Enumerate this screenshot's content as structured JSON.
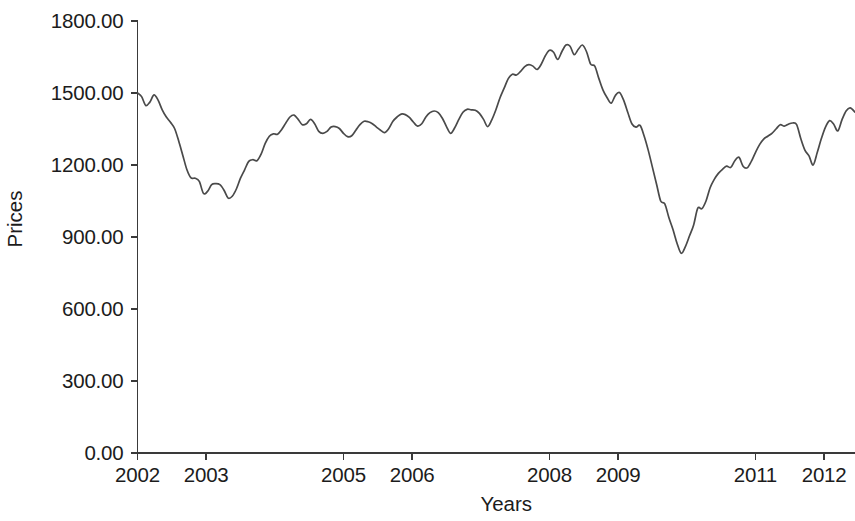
{
  "chart_data": {
    "type": "line",
    "title": "",
    "xlabel": "Years",
    "ylabel": "Prices",
    "grid": false,
    "legend": false,
    "legend_position": "none",
    "line_color": "#4a4a4a",
    "axis_color": "#3a3a3a",
    "background_color": "#ffffff",
    "xlim": [
      2002.0,
      2012.45
    ],
    "ylim": [
      0.0,
      1800.0
    ],
    "y_ticks": [
      0,
      300,
      600,
      900,
      1200,
      1500,
      1800
    ],
    "y_tick_labels": [
      "0.00",
      "300.00",
      "600.00",
      "900.00",
      "1200.00",
      "1500.00",
      "1800.00"
    ],
    "x_ticks": [
      2002,
      2003,
      2005,
      2006,
      2008,
      2009,
      2011,
      2012
    ],
    "x_tick_labels": [
      "2002",
      "2003",
      "2005",
      "2006",
      "2008",
      "2009",
      "2011",
      "2012"
    ],
    "series": [
      {
        "name": "Prices",
        "x": [
          2002.0,
          2002.06,
          2002.12,
          2002.18,
          2002.24,
          2002.3,
          2002.36,
          2002.42,
          2002.48,
          2002.54,
          2002.6,
          2002.66,
          2002.72,
          2002.78,
          2002.84,
          2002.9,
          2002.96,
          2003.02,
          2003.08,
          2003.14,
          2003.2,
          2003.26,
          2003.32,
          2003.38,
          2003.44,
          2003.5,
          2003.56,
          2003.62,
          2003.68,
          2003.74,
          2003.8,
          2003.86,
          2003.92,
          2003.98,
          2004.04,
          2004.1,
          2004.16,
          2004.22,
          2004.28,
          2004.34,
          2004.4,
          2004.46,
          2004.52,
          2004.58,
          2004.64,
          2004.7,
          2004.76,
          2004.82,
          2004.88,
          2004.94,
          2005.0,
          2005.06,
          2005.12,
          2005.18,
          2005.24,
          2005.3,
          2005.36,
          2005.42,
          2005.48,
          2005.54,
          2005.6,
          2005.66,
          2005.72,
          2005.78,
          2005.84,
          2005.9,
          2005.96,
          2006.02,
          2006.08,
          2006.14,
          2006.2,
          2006.26,
          2006.32,
          2006.38,
          2006.44,
          2006.5,
          2006.56,
          2006.62,
          2006.68,
          2006.74,
          2006.8,
          2006.86,
          2006.92,
          2006.98,
          2007.04,
          2007.1,
          2007.16,
          2007.22,
          2007.28,
          2007.34,
          2007.4,
          2007.46,
          2007.52,
          2007.58,
          2007.64,
          2007.7,
          2007.76,
          2007.82,
          2007.88,
          2007.94,
          2008.0,
          2008.06,
          2008.12,
          2008.18,
          2008.24,
          2008.3,
          2008.36,
          2008.42,
          2008.48,
          2008.54,
          2008.6,
          2008.66,
          2008.72,
          2008.78,
          2008.84,
          2008.9,
          2008.96,
          2009.02,
          2009.08,
          2009.14,
          2009.2,
          2009.26,
          2009.32,
          2009.38,
          2009.44,
          2009.5,
          2009.56,
          2009.62,
          2009.68,
          2009.74,
          2009.8,
          2009.86,
          2009.92,
          2009.98,
          2010.04,
          2010.1,
          2010.16,
          2010.22,
          2010.28,
          2010.34,
          2010.4,
          2010.46,
          2010.52,
          2010.58,
          2010.64,
          2010.7,
          2010.76,
          2010.82,
          2010.88,
          2010.94,
          2011.0,
          2011.06,
          2011.12,
          2011.18,
          2011.24,
          2011.3,
          2011.36,
          2011.42,
          2011.48,
          2011.54,
          2011.6,
          2011.66,
          2011.72,
          2011.78,
          2011.84,
          2011.9,
          2011.96,
          2012.02,
          2012.08,
          2012.14,
          2012.2,
          2012.26,
          2012.32,
          2012.38,
          2012.45
        ],
        "y": [
          1500,
          1485,
          1448,
          1462,
          1492,
          1470,
          1430,
          1400,
          1378,
          1352,
          1300,
          1240,
          1180,
          1146,
          1145,
          1132,
          1082,
          1090,
          1118,
          1122,
          1118,
          1095,
          1062,
          1070,
          1100,
          1145,
          1180,
          1215,
          1222,
          1218,
          1245,
          1290,
          1320,
          1330,
          1328,
          1348,
          1375,
          1400,
          1408,
          1390,
          1368,
          1372,
          1390,
          1372,
          1340,
          1332,
          1340,
          1358,
          1360,
          1352,
          1332,
          1318,
          1322,
          1345,
          1368,
          1382,
          1380,
          1372,
          1358,
          1345,
          1335,
          1352,
          1382,
          1400,
          1412,
          1410,
          1398,
          1378,
          1362,
          1372,
          1400,
          1418,
          1425,
          1418,
          1395,
          1360,
          1332,
          1355,
          1390,
          1420,
          1432,
          1430,
          1428,
          1415,
          1390,
          1360,
          1388,
          1430,
          1480,
          1520,
          1560,
          1578,
          1575,
          1590,
          1610,
          1618,
          1612,
          1598,
          1620,
          1655,
          1678,
          1670,
          1640,
          1672,
          1700,
          1695,
          1660,
          1682,
          1700,
          1672,
          1620,
          1612,
          1560,
          1512,
          1480,
          1458,
          1490,
          1502,
          1470,
          1420,
          1372,
          1358,
          1365,
          1320,
          1260,
          1190,
          1120,
          1050,
          1038,
          980,
          930,
          872,
          832,
          860,
          905,
          950,
          1020,
          1018,
          1050,
          1105,
          1140,
          1165,
          1182,
          1195,
          1190,
          1218,
          1232,
          1195,
          1188,
          1215,
          1252,
          1285,
          1308,
          1320,
          1332,
          1350,
          1368,
          1362,
          1370,
          1375,
          1368,
          1310,
          1262,
          1238,
          1200,
          1252,
          1310,
          1358,
          1385,
          1370,
          1342,
          1388,
          1425,
          1438,
          1420
        ]
      }
    ],
    "annotations": {
      "start_value": 1500,
      "first_trough_value": 1062,
      "first_trough_year": 2003.32,
      "peak_value": 1700,
      "peak_year": 2008.24,
      "crash_low_value": 832,
      "crash_low_year": 2009.92,
      "end_value": 1420
    }
  },
  "axes": {
    "y_title": "Prices",
    "x_title": "Years"
  }
}
